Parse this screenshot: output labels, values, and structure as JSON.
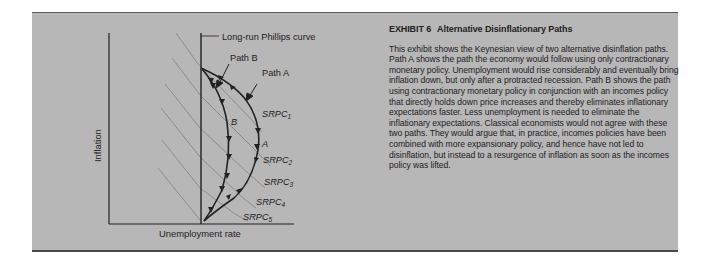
{
  "exhibit": {
    "number_label": "EXHIBIT 6",
    "title": "Alternative Disinflationary Paths",
    "body": "This exhibit shows the Keynesian view of two alternative disinflation paths. Path A shows the path the economy would follow using only contractionary monetary policy. Unemployment would rise considerably and eventually bring inflation down, but only after a protracted recession. Path B shows the path using contractionary monetary policy in conjunction with an incomes policy that directly holds down price increases and thereby eliminates inflationary expectations faster. Less unemployment is needed to eliminate the inflationary expectations. Classical economists would not agree with these two paths. They would argue that, in practice, incomes policies have been combined with more expansionary policy, and hence have not led to disinflation, but instead to a resurgence of inflation as soon as the incomes policy was lifted."
  },
  "diagram": {
    "x_axis_label": "Unemployment rate",
    "y_axis_label": "Inflation",
    "lrpc_label": "Long-run Phillips curve",
    "path_a_label": "Path A",
    "path_b_label": "Path B",
    "curve_a_letter": "A",
    "curve_b_letter": "B",
    "srpc": [
      {
        "base": "SRPC",
        "sub": "1"
      },
      {
        "base": "SRPC",
        "sub": "2"
      },
      {
        "base": "SRPC",
        "sub": "3"
      },
      {
        "base": "SRPC",
        "sub": "4"
      },
      {
        "base": "SRPC",
        "sub": "5"
      }
    ]
  },
  "colors": {
    "panel_bg": "#b7b7b7",
    "ink": "#222222",
    "srpc_line": "#6e6e6e"
  }
}
